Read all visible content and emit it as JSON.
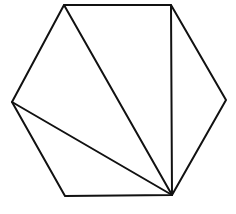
{
  "diagram": {
    "shape": "hexagon",
    "stroke_color": "#111111",
    "background": "#ffffff",
    "vertices": [
      {
        "id": "A",
        "x": 64,
        "y": 5
      },
      {
        "id": "B",
        "x": 171,
        "y": 5
      },
      {
        "id": "C",
        "x": 226,
        "y": 100
      },
      {
        "id": "D",
        "x": 172,
        "y": 195
      },
      {
        "id": "E",
        "x": 65,
        "y": 196
      },
      {
        "id": "F",
        "x": 12,
        "y": 102
      }
    ],
    "diagonals": [
      {
        "from": "D",
        "to": "A"
      },
      {
        "from": "D",
        "to": "B"
      },
      {
        "from": "D",
        "to": "F"
      }
    ]
  }
}
